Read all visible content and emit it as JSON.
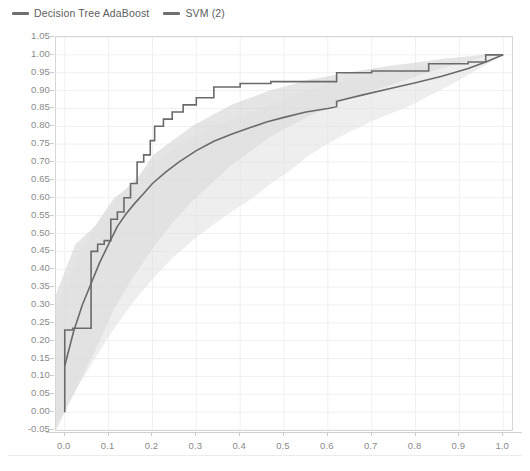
{
  "legend": {
    "position": "top-left",
    "entries": [
      {
        "label": "Decision Tree AdaBoost",
        "color": "#707070",
        "icon": "line-swatch-icon"
      },
      {
        "label": "SVM (2)",
        "color": "#707070",
        "icon": "line-swatch-icon"
      }
    ]
  },
  "axes": {
    "x": {
      "ticks": [
        "0.0",
        "0.1",
        "0.2",
        "0.3",
        "0.4",
        "0.5",
        "0.6",
        "0.7",
        "0.8",
        "0.9",
        "1.0"
      ],
      "min": 0.0,
      "max": 1.0
    },
    "y": {
      "ticks": [
        "1.05",
        "1.00",
        "0.95",
        "0.90",
        "0.85",
        "0.80",
        "0.75",
        "0.70",
        "0.65",
        "0.60",
        "0.55",
        "0.50",
        "0.45",
        "0.40",
        "0.35",
        "0.30",
        "0.25",
        "0.20",
        "0.15",
        "0.10",
        "0.05",
        "0.00",
        "-0.05"
      ],
      "min": -0.05,
      "max": 1.05
    }
  },
  "chart_data": {
    "type": "line",
    "title": "",
    "xlabel": "",
    "ylabel": "",
    "xlim": [
      -0.02,
      1.02
    ],
    "ylim": [
      -0.05,
      1.05
    ],
    "grid": true,
    "legend_position": "top-left",
    "series": [
      {
        "name": "Decision Tree AdaBoost",
        "color": "#6a6a6a",
        "style": "step",
        "band_color": "#cfcfcf",
        "band_opacity": 0.55,
        "x": [
          0.0,
          0.0,
          0.018,
          0.018,
          0.06,
          0.06,
          0.075,
          0.075,
          0.09,
          0.09,
          0.105,
          0.105,
          0.12,
          0.12,
          0.135,
          0.135,
          0.15,
          0.15,
          0.165,
          0.165,
          0.18,
          0.18,
          0.195,
          0.195,
          0.205,
          0.205,
          0.225,
          0.225,
          0.245,
          0.245,
          0.27,
          0.27,
          0.3,
          0.3,
          0.34,
          0.34,
          0.4,
          0.4,
          0.47,
          0.47,
          0.62,
          0.62,
          0.7,
          0.7,
          0.83,
          0.83,
          0.92,
          0.92,
          0.96,
          0.96,
          1.0
        ],
        "y": [
          0.0,
          0.23,
          0.23,
          0.235,
          0.235,
          0.45,
          0.45,
          0.47,
          0.47,
          0.48,
          0.48,
          0.54,
          0.54,
          0.56,
          0.56,
          0.6,
          0.6,
          0.64,
          0.64,
          0.7,
          0.7,
          0.72,
          0.72,
          0.76,
          0.76,
          0.8,
          0.8,
          0.82,
          0.82,
          0.84,
          0.84,
          0.86,
          0.86,
          0.88,
          0.88,
          0.91,
          0.91,
          0.92,
          0.92,
          0.925,
          0.925,
          0.95,
          0.95,
          0.955,
          0.955,
          0.975,
          0.975,
          0.98,
          0.98,
          1.0,
          1.0
        ],
        "band_upper": [
          0.33,
          0.47,
          0.52,
          0.6,
          0.64,
          0.72,
          0.76,
          0.8,
          0.83,
          0.86,
          0.88,
          0.9,
          0.915,
          0.93,
          0.94,
          0.95,
          0.96,
          0.968,
          0.975,
          0.982,
          0.99,
          0.995,
          1.0,
          1.0
        ],
        "band_lower": [
          -0.05,
          0.06,
          0.17,
          0.29,
          0.38,
          0.46,
          0.53,
          0.59,
          0.64,
          0.69,
          0.73,
          0.77,
          0.8,
          0.828,
          0.852,
          0.875,
          0.895,
          0.912,
          0.93,
          0.948,
          0.965,
          0.98,
          0.993,
          1.0
        ]
      },
      {
        "name": "SVM (2)",
        "color": "#6a6a6a",
        "style": "smooth",
        "band_color": "#e0e0e0",
        "band_opacity": 0.55,
        "x": [
          0.0,
          0.02,
          0.04,
          0.06,
          0.08,
          0.1,
          0.12,
          0.14,
          0.16,
          0.18,
          0.2,
          0.23,
          0.26,
          0.3,
          0.34,
          0.38,
          0.42,
          0.46,
          0.5,
          0.55,
          0.6,
          0.62,
          0.62,
          0.68,
          0.74,
          0.8,
          0.86,
          0.92,
          0.96,
          1.0
        ],
        "y": [
          0.13,
          0.225,
          0.3,
          0.36,
          0.42,
          0.47,
          0.52,
          0.555,
          0.585,
          0.612,
          0.64,
          0.672,
          0.7,
          0.732,
          0.758,
          0.778,
          0.795,
          0.812,
          0.825,
          0.84,
          0.85,
          0.855,
          0.87,
          0.888,
          0.905,
          0.922,
          0.94,
          0.962,
          0.98,
          1.0
        ],
        "band_upper": [
          0.29,
          0.42,
          0.52,
          0.59,
          0.648,
          0.695,
          0.735,
          0.768,
          0.795,
          0.818,
          0.838,
          0.862,
          0.882,
          0.903,
          0.918,
          0.931,
          0.942,
          0.952,
          0.96,
          0.97,
          0.978,
          0.985,
          0.992,
          1.0
        ],
        "band_lower": [
          -0.03,
          0.06,
          0.15,
          0.235,
          0.31,
          0.375,
          0.432,
          0.48,
          0.522,
          0.56,
          0.595,
          0.638,
          0.675,
          0.718,
          0.752,
          0.782,
          0.808,
          0.832,
          0.852,
          0.88,
          0.908,
          0.938,
          0.968,
          1.0
        ]
      }
    ]
  }
}
